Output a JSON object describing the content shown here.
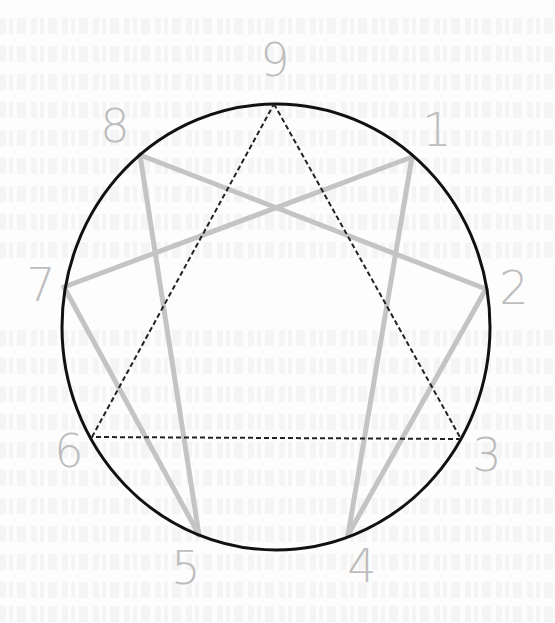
{
  "figure": {
    "colors": {
      "background": "#fdfdfd",
      "circle": "#111111",
      "triangle": "#222222",
      "hexad": "#c4c4c4",
      "labels": "#bdbdbd"
    },
    "circle": {
      "cx": 276,
      "cy": 327,
      "rx": 214,
      "ry": 223
    },
    "points": [
      {
        "id": "1",
        "label": "1",
        "x": 412,
        "y": 157,
        "label_x": 437,
        "label_y": 130
      },
      {
        "id": "2",
        "label": "2",
        "x": 486,
        "y": 289,
        "label_x": 514,
        "label_y": 288
      },
      {
        "id": "3",
        "label": "3",
        "x": 461,
        "y": 439,
        "label_x": 487,
        "label_y": 455
      },
      {
        "id": "4",
        "label": "4",
        "x": 348,
        "y": 535,
        "label_x": 362,
        "label_y": 566
      },
      {
        "id": "5",
        "label": "5",
        "x": 199,
        "y": 535,
        "label_x": 186,
        "label_y": 568
      },
      {
        "id": "6",
        "label": "6",
        "x": 92,
        "y": 437,
        "label_x": 69,
        "label_y": 451
      },
      {
        "id": "7",
        "label": "7",
        "x": 64,
        "y": 287,
        "label_x": 41,
        "label_y": 285
      },
      {
        "id": "8",
        "label": "8",
        "x": 140,
        "y": 155,
        "label_x": 115,
        "label_y": 126
      },
      {
        "id": "9",
        "label": "9",
        "x": 274,
        "y": 104,
        "label_x": 275,
        "label_y": 60
      }
    ],
    "triangle": [
      "9",
      "3",
      "6"
    ],
    "hexad": [
      "1",
      "4",
      "2",
      "8",
      "5",
      "7"
    ]
  }
}
